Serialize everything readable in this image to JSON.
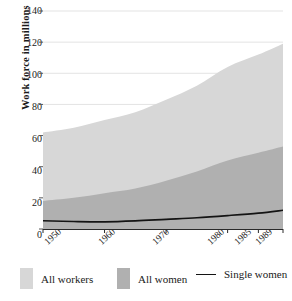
{
  "chart_data": {
    "type": "area",
    "title": "",
    "xlabel": "",
    "ylabel": "Work force in millions",
    "ylim": [
      0,
      140
    ],
    "yticks": [
      0,
      20,
      40,
      60,
      80,
      100,
      120,
      140
    ],
    "ytick_labels": [
      "0",
      "20",
      "40",
      "60",
      "80",
      "100",
      "120",
      "140"
    ],
    "categories": [
      "1950",
      "1960",
      "1970",
      "1980",
      "1985",
      "1989"
    ],
    "x": [
      1950,
      1960,
      1970,
      1980,
      1985,
      1989
    ],
    "xlim": [
      1950,
      1989
    ],
    "grid": "horizontal",
    "legend_position": "bottom",
    "series": [
      {
        "name": "All workers",
        "type": "area",
        "color": "#d7d7d7",
        "x": [
          1950,
          1955,
          1960,
          1965,
          1970,
          1975,
          1980,
          1985,
          1989
        ],
        "values": [
          62,
          65,
          70,
          75,
          83,
          92,
          104,
          112,
          119
        ]
      },
      {
        "name": "All women",
        "type": "area",
        "color": "#b0b0b0",
        "x": [
          1950,
          1955,
          1960,
          1965,
          1970,
          1975,
          1980,
          1985,
          1989
        ],
        "values": [
          18,
          20,
          23,
          26,
          31,
          37,
          44,
          49,
          53
        ]
      },
      {
        "name": "Single women",
        "type": "line",
        "color": "#141414",
        "x": [
          1950,
          1955,
          1960,
          1965,
          1970,
          1975,
          1980,
          1985,
          1989
        ],
        "values": [
          5.3,
          4.8,
          4.6,
          5.2,
          6.2,
          7.2,
          8.6,
          10.2,
          12.0
        ]
      }
    ]
  },
  "axes": {
    "y_title": "Work force in millions",
    "y_tick_labels": [
      "140",
      "120",
      "100",
      "80",
      "60",
      "40",
      "20",
      "0"
    ],
    "x_tick_labels": [
      "1950",
      "1960",
      "1970",
      "1980",
      "1985",
      "1989"
    ]
  },
  "legend": {
    "items": [
      {
        "label": "All workers",
        "marker": "swatch",
        "color": "#d7d7d7"
      },
      {
        "label": "All women",
        "marker": "swatch",
        "color": "#b0b0b0"
      },
      {
        "label": "Single women",
        "marker": "line",
        "color": "#141414"
      }
    ]
  }
}
